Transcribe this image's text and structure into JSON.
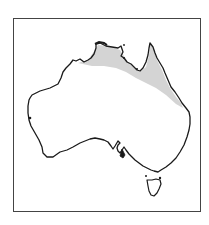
{
  "map": {
    "subject": "Australia distribution map",
    "region_highlighted": "Northern Australia and eastern Queensland coast",
    "colors": {
      "outline": "#1a1a1a",
      "shaded_range": "#d4d4d4",
      "land": "#ffffff",
      "frame": "#444444"
    }
  }
}
